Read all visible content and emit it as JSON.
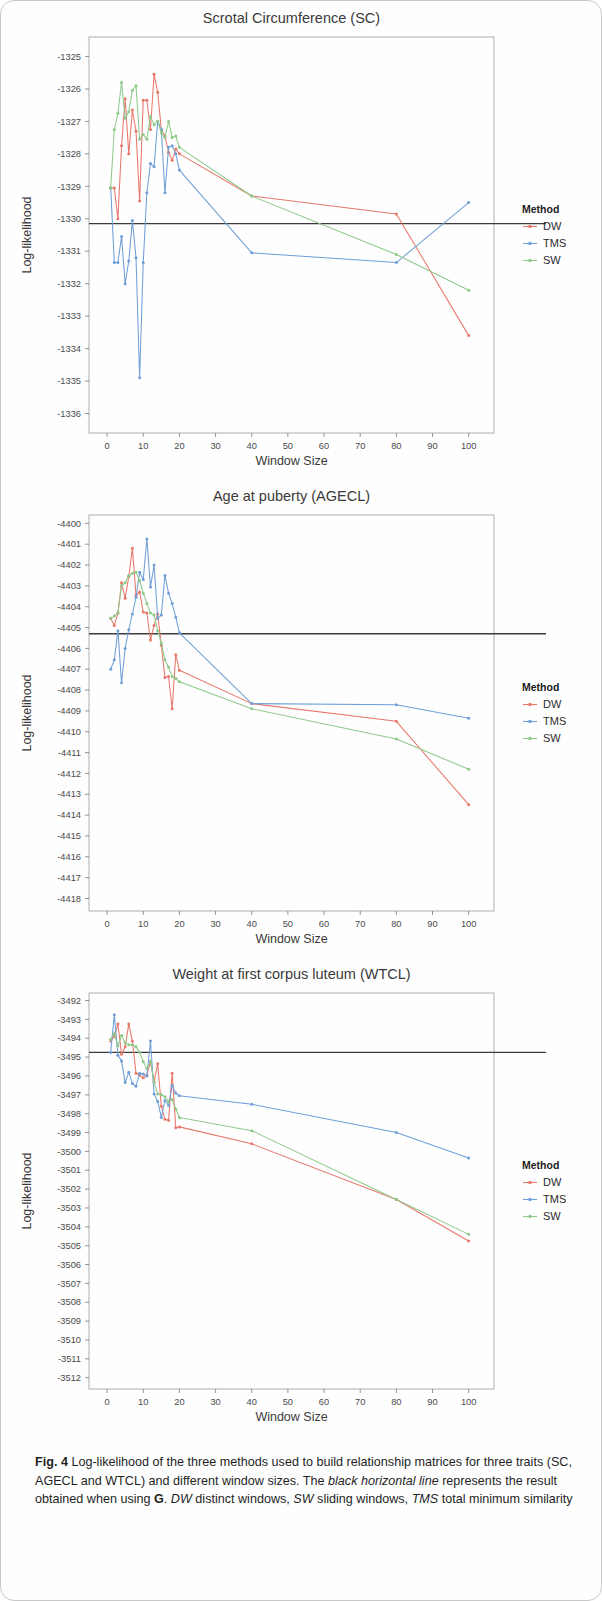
{
  "figure": {
    "label": "Fig. 4",
    "caption_part1": "Log-likelihood of the three methods used to build relationship matrices for three traits (SC, AGECL and WTCL) and different window sizes. The ",
    "caption_em1": "black horizontal line",
    "caption_part2": " represents the result obtained when using ",
    "caption_bold_g": "G",
    "caption_part3": ". ",
    "caption_em2": "DW",
    "caption_part4": " distinct windows, ",
    "caption_em3": "SW",
    "caption_part5": " sliding windows, ",
    "caption_em4": "TMS",
    "caption_part6": " total minimum similarity"
  },
  "legend": {
    "title": "Method",
    "entries": [
      {
        "label": "DW",
        "color": "#e8776b"
      },
      {
        "label": "TMS",
        "color": "#6f9fd8"
      },
      {
        "label": "SW",
        "color": "#8fc98a"
      }
    ]
  },
  "colors": {
    "DW": "#e8776b",
    "TMS": "#6f9fd8",
    "SW": "#8fc98a",
    "reference_line": "#3b3b3b",
    "axis": "#8d8d8d",
    "background": "#ffffff"
  },
  "chart_data": [
    {
      "type": "line",
      "title": "Scrotal Circumference (SC)",
      "xlabel": "Window  Size",
      "ylabel": "Log-likelihood",
      "xlim": [
        -5,
        107
      ],
      "ylim": [
        -1336.6,
        -1324.4
      ],
      "xticks": [
        0,
        10,
        20,
        30,
        40,
        50,
        60,
        70,
        80,
        90,
        100
      ],
      "yticks": [
        -1325,
        -1326,
        -1327,
        -1328,
        -1329,
        -1330,
        -1331,
        -1332,
        -1333,
        -1334,
        -1335,
        -1336
      ],
      "grid": false,
      "legend_position": "right",
      "reference_line": -1330.15,
      "series": [
        {
          "name": "DW",
          "x": [
            1,
            2,
            3,
            4,
            5,
            6,
            7,
            8,
            9,
            10,
            11,
            12,
            13,
            14,
            15,
            16,
            17,
            18,
            19,
            20,
            40,
            80,
            100
          ],
          "y": [
            -1329.05,
            -1329.05,
            -1330.0,
            -1327.75,
            -1326.3,
            -1328.0,
            -1326.65,
            -1327.3,
            -1329.45,
            -1326.35,
            -1326.35,
            -1327.25,
            -1325.55,
            -1326.1,
            -1327.25,
            -1327.45,
            -1327.95,
            -1328.2,
            -1327.85,
            -1328.0,
            -1329.3,
            -1329.85,
            -1333.6
          ]
        },
        {
          "name": "TMS",
          "x": [
            1,
            2,
            3,
            4,
            5,
            6,
            7,
            8,
            9,
            10,
            11,
            12,
            13,
            14,
            15,
            16,
            17,
            18,
            19,
            20,
            40,
            80,
            100
          ],
          "y": [
            -1329.05,
            -1331.35,
            -1331.35,
            -1330.55,
            -1332.0,
            -1331.3,
            -1330.05,
            -1331.2,
            -1334.9,
            -1331.35,
            -1329.2,
            -1328.3,
            -1328.4,
            -1327.0,
            -1327.25,
            -1329.2,
            -1327.8,
            -1327.75,
            -1328.0,
            -1328.5,
            -1331.05,
            -1331.35,
            -1329.5
          ]
        },
        {
          "name": "SW",
          "x": [
            1,
            2,
            3,
            4,
            5,
            6,
            7,
            8,
            9,
            10,
            11,
            12,
            13,
            14,
            15,
            16,
            17,
            18,
            19,
            20,
            40,
            80,
            100
          ],
          "y": [
            -1329.05,
            -1327.25,
            -1326.75,
            -1325.8,
            -1326.9,
            -1326.7,
            -1326.05,
            -1325.9,
            -1327.55,
            -1327.4,
            -1327.55,
            -1326.85,
            -1327.1,
            -1327.0,
            -1327.35,
            -1327.5,
            -1327.0,
            -1327.5,
            -1327.45,
            -1327.8,
            -1329.3,
            -1331.1,
            -1332.2
          ]
        }
      ]
    },
    {
      "type": "line",
      "title": "Age at puberty (AGECL)",
      "xlabel": "Window  Size",
      "ylabel": "Log-likelihood",
      "xlim": [
        -5,
        107
      ],
      "ylim": [
        -4418.6,
        -4399.6
      ],
      "xticks": [
        0,
        10,
        20,
        30,
        40,
        50,
        60,
        70,
        80,
        90,
        100
      ],
      "yticks": [
        -4400,
        -4401,
        -4402,
        -4403,
        -4404,
        -4405,
        -4406,
        -4407,
        -4408,
        -4409,
        -4410,
        -4411,
        -4412,
        -4413,
        -4414,
        -4415,
        -4416,
        -4417,
        -4418
      ],
      "grid": false,
      "legend_position": "right",
      "reference_line": -4405.3,
      "series": [
        {
          "name": "DW",
          "x": [
            1,
            2,
            3,
            4,
            5,
            6,
            7,
            8,
            9,
            10,
            11,
            12,
            13,
            14,
            15,
            16,
            17,
            18,
            19,
            20,
            40,
            80,
            100
          ],
          "y": [
            -4404.55,
            -4404.9,
            -4404.3,
            -4402.85,
            -4403.6,
            -4402.55,
            -4401.2,
            -4403.45,
            -4403.3,
            -4404.25,
            -4404.3,
            -4405.6,
            -4404.9,
            -4404.35,
            -4405.85,
            -4407.4,
            -4407.35,
            -4408.9,
            -4406.3,
            -4407.05,
            -4408.65,
            -4409.5,
            -4413.5
          ]
        },
        {
          "name": "TMS",
          "x": [
            1,
            2,
            3,
            4,
            5,
            6,
            7,
            8,
            9,
            10,
            11,
            12,
            13,
            14,
            15,
            16,
            17,
            18,
            19,
            20,
            40,
            80,
            100
          ],
          "y": [
            -4407.0,
            -4406.55,
            -4405.15,
            -4407.65,
            -4406.0,
            -4405.1,
            -4404.35,
            -4403.55,
            -4402.35,
            -4402.7,
            -4400.75,
            -4403.05,
            -4402.0,
            -4404.55,
            -4404.4,
            -4402.5,
            -4403.35,
            -4403.85,
            -4404.5,
            -4405.25,
            -4408.65,
            -4408.7,
            -4409.35
          ]
        },
        {
          "name": "SW",
          "x": [
            1,
            2,
            3,
            4,
            5,
            6,
            7,
            8,
            9,
            10,
            11,
            12,
            13,
            14,
            15,
            16,
            17,
            18,
            19,
            20,
            40,
            80,
            100
          ],
          "y": [
            -4404.55,
            -4404.45,
            -4404.3,
            -4403.0,
            -4402.85,
            -4402.5,
            -4402.4,
            -4402.35,
            -4402.75,
            -4403.35,
            -4403.85,
            -4404.3,
            -4404.4,
            -4405.15,
            -4405.75,
            -4406.55,
            -4406.9,
            -4407.35,
            -4407.45,
            -4407.6,
            -4408.9,
            -4410.35,
            -4411.8
          ]
        }
      ]
    },
    {
      "type": "line",
      "title": "Weight at first corpus luteum (WTCL)",
      "xlabel": "Window  Size",
      "ylabel": "Log-likelihood",
      "xlim": [
        -5,
        107
      ],
      "ylim": [
        -3512.6,
        -3491.6
      ],
      "xticks": [
        0,
        10,
        20,
        30,
        40,
        50,
        60,
        70,
        80,
        90,
        100
      ],
      "yticks": [
        -3492,
        -3493,
        -3494,
        -3495,
        -3496,
        -3497,
        -3498,
        -3499,
        -3500,
        -3501,
        -3502,
        -3503,
        -3504,
        -3505,
        -3506,
        -3507,
        -3508,
        -3509,
        -3510,
        -3511,
        -3512
      ],
      "grid": false,
      "legend_position": "right",
      "reference_line": -3494.75,
      "series": [
        {
          "name": "DW",
          "x": [
            1,
            2,
            3,
            4,
            5,
            6,
            7,
            8,
            9,
            10,
            11,
            12,
            13,
            14,
            15,
            16,
            17,
            18,
            19,
            20,
            40,
            80,
            100
          ],
          "y": [
            -3494.15,
            -3493.9,
            -3493.25,
            -3494.85,
            -3494.45,
            -3493.25,
            -3494.15,
            -3495.85,
            -3495.95,
            -3496.1,
            -3495.95,
            -3495.25,
            -3496.3,
            -3495.35,
            -3497.6,
            -3498.3,
            -3498.35,
            -3495.85,
            -3498.75,
            -3498.7,
            -3499.6,
            -3502.55,
            -3504.75
          ]
        },
        {
          "name": "TMS",
          "x": [
            1,
            2,
            3,
            4,
            5,
            6,
            7,
            8,
            9,
            10,
            11,
            12,
            13,
            14,
            15,
            16,
            17,
            18,
            19,
            20,
            40,
            80,
            100
          ],
          "y": [
            -3494.75,
            -3492.75,
            -3494.9,
            -3495.2,
            -3496.35,
            -3495.8,
            -3496.4,
            -3496.55,
            -3495.85,
            -3495.9,
            -3496.0,
            -3494.15,
            -3496.95,
            -3497.35,
            -3498.2,
            -3497.3,
            -3497.55,
            -3496.5,
            -3496.9,
            -3497.05,
            -3497.5,
            -3499.0,
            -3500.35
          ]
        },
        {
          "name": "SW",
          "x": [
            1,
            2,
            3,
            4,
            5,
            6,
            7,
            8,
            9,
            10,
            11,
            12,
            13,
            14,
            15,
            16,
            17,
            18,
            19,
            20,
            40,
            80,
            100
          ],
          "y": [
            -3494.05,
            -3493.75,
            -3494.4,
            -3493.85,
            -3494.25,
            -3494.35,
            -3494.35,
            -3494.45,
            -3494.75,
            -3495.25,
            -3495.6,
            -3495.2,
            -3496.35,
            -3496.95,
            -3497.0,
            -3497.1,
            -3497.35,
            -3497.25,
            -3497.75,
            -3498.2,
            -3498.9,
            -3502.55,
            -3504.4
          ]
        }
      ]
    }
  ]
}
